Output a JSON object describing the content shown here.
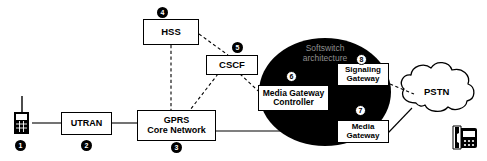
{
  "diagram": {
    "zone_label": "Softswitch\narchitecture",
    "colors": {
      "line": "#000000",
      "box_fill": "#ffffff",
      "ellipse_fill": "#000000",
      "zone_text": "#8e8e8e",
      "marker_dark_fill": "#000000",
      "marker_dark_text": "#ffffff",
      "marker_light_fill": "#ffffff",
      "marker_light_text": "#000000"
    },
    "nodes": [
      {
        "id": "mobile",
        "label": "",
        "icon": "mobile-phone-icon"
      },
      {
        "id": "utran",
        "label": "UTRAN",
        "icon": ""
      },
      {
        "id": "gprs",
        "label": "GPRS\nCore Network",
        "icon": ""
      },
      {
        "id": "hss",
        "label": "HSS",
        "icon": ""
      },
      {
        "id": "cscf",
        "label": "CSCF",
        "icon": ""
      },
      {
        "id": "mgc",
        "label": "Media Gateway\nController",
        "icon": ""
      },
      {
        "id": "mgw",
        "label": "Media\nGateway",
        "icon": ""
      },
      {
        "id": "sgw",
        "label": "Signaling\nGateway",
        "icon": ""
      },
      {
        "id": "pstn",
        "label": "PSTN",
        "icon": "cloud-icon"
      },
      {
        "id": "deskphone",
        "label": "",
        "icon": "desk-phone-icon"
      }
    ],
    "markers": [
      {
        "number": "1",
        "target": "mobile",
        "style": "dark"
      },
      {
        "number": "2",
        "target": "utran",
        "style": "dark"
      },
      {
        "number": "3",
        "target": "gprs",
        "style": "dark"
      },
      {
        "number": "4",
        "target": "hss",
        "style": "dark"
      },
      {
        "number": "5",
        "target": "cscf",
        "style": "dark"
      },
      {
        "number": "6",
        "target": "mgc",
        "style": "light"
      },
      {
        "number": "7",
        "target": "mgw",
        "style": "light"
      },
      {
        "number": "8",
        "target": "sgw",
        "style": "light"
      }
    ],
    "links": [
      {
        "from": "mobile",
        "to": "utran",
        "style": "solid"
      },
      {
        "from": "utran",
        "to": "gprs",
        "style": "solid"
      },
      {
        "from": "gprs",
        "to": "mgw",
        "style": "solid"
      },
      {
        "from": "hss",
        "to": "gprs",
        "style": "dashed"
      },
      {
        "from": "hss",
        "to": "cscf",
        "style": "dashed"
      },
      {
        "from": "cscf",
        "to": "gprs",
        "style": "dashed"
      },
      {
        "from": "cscf",
        "to": "mgc",
        "style": "dashed"
      },
      {
        "from": "mgc",
        "to": "sgw",
        "style": "dashed"
      },
      {
        "from": "mgc",
        "to": "mgw",
        "style": "dashed"
      },
      {
        "from": "sgw",
        "to": "pstn",
        "style": "dashed"
      },
      {
        "from": "mgw",
        "to": "pstn",
        "style": "solid"
      }
    ]
  }
}
